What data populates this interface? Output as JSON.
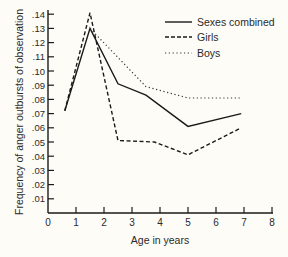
{
  "chart_data": {
    "type": "line",
    "title": "",
    "xlabel": "Age in years",
    "ylabel": "Frequency of anger outbursts of observation",
    "xlim": [
      0,
      8
    ],
    "ylim": [
      0,
      0.14
    ],
    "x_ticks": [
      "0",
      "1",
      "2",
      "3",
      "4",
      "5",
      "6",
      "7",
      "8"
    ],
    "y_ticks": [
      ".01",
      ".02",
      ".03",
      ".04",
      ".05",
      ".06",
      ".07",
      ".08",
      ".09",
      ".10",
      ".11",
      ".12",
      ".13",
      ".14"
    ],
    "grid": false,
    "legend_position": "top-right",
    "series": [
      {
        "name": "Sexes combined",
        "style": "solid",
        "x": [
          0.6,
          1.5,
          2.5,
          3.5,
          5.0,
          6.9
        ],
        "y": [
          0.072,
          0.13,
          0.091,
          0.083,
          0.061,
          0.07
        ]
      },
      {
        "name": "Girls",
        "style": "dashed",
        "x": [
          0.6,
          1.5,
          2.5,
          3.8,
          5.0,
          6.9
        ],
        "y": [
          0.072,
          0.141,
          0.051,
          0.05,
          0.041,
          0.06
        ]
      },
      {
        "name": "Boys",
        "style": "dotted",
        "x": [
          1.5,
          3.5,
          5.0,
          6.9
        ],
        "y": [
          0.13,
          0.089,
          0.081,
          0.081
        ]
      }
    ]
  },
  "legend": {
    "items": [
      {
        "label": "Sexes combined",
        "style": "solid"
      },
      {
        "label": "Girls",
        "style": "dashed"
      },
      {
        "label": "Boys",
        "style": "dotted"
      }
    ]
  },
  "colors": {
    "background": "#fdfcf7",
    "ink": "#1a1a1a"
  }
}
